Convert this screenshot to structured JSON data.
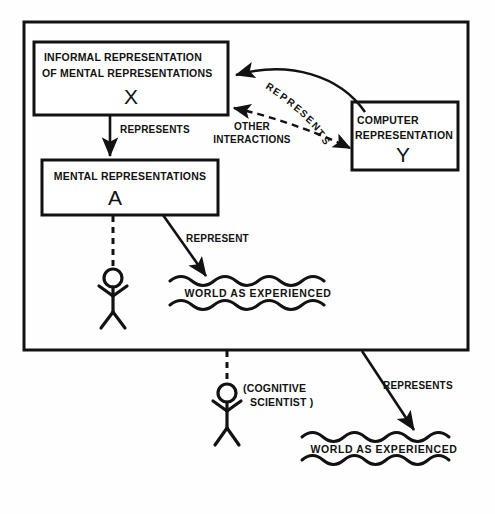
{
  "figure": {
    "background_color": "#fefefe",
    "ink_color": "#121212"
  },
  "outer_frame": {
    "name": "cognitive-scientist-scope-frame"
  },
  "boxes": {
    "informal": {
      "line1": "INFORMAL REPRESENTATION",
      "line2": "OF MENTAL REPRESENTATIONS",
      "symbol": "X"
    },
    "mental": {
      "line1": "MENTAL  REPRESENTATIONS",
      "symbol": "A"
    },
    "computer": {
      "line1": "COMPUTER",
      "line2": "REPRESENTATION",
      "symbol": "Y"
    }
  },
  "edges": {
    "informal_to_mental": "REPRESENTS",
    "computer_to_informal": "REPRESENTS",
    "other_interactions_line1": "OTHER",
    "other_interactions_line2": "INTERACTIONS",
    "mental_to_world": "REPRESENT",
    "frame_to_world": "REPRESENTS"
  },
  "worlds": {
    "inner": "WORLD AS EXPERIENCED",
    "outer": "WORLD AS EXPERIENCED"
  },
  "actors": {
    "inner_figure_label": "",
    "outer_figure_label_line1": "(COGNITIVE",
    "outer_figure_label_line2": "SCIENTIST )"
  },
  "curved_label_letters": [
    "R",
    "E",
    "P",
    "R",
    "E",
    "S",
    "E",
    "N",
    "T",
    "S"
  ]
}
